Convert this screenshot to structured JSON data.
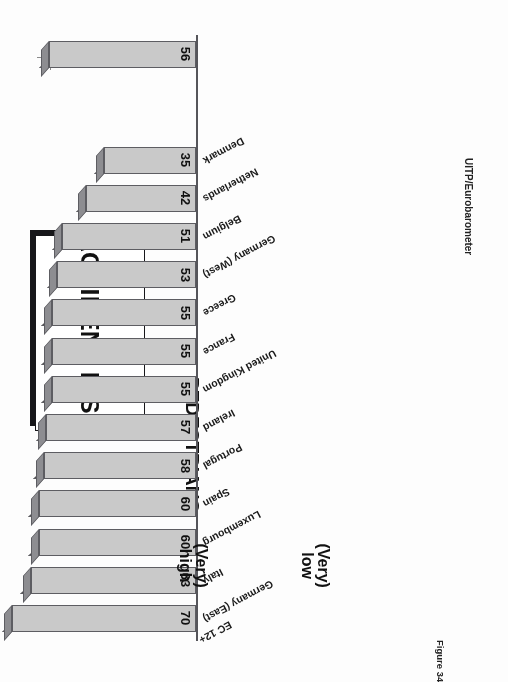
{
  "figure": {
    "title": "ACCIDENT RISK",
    "subtitle": "PEDESTRIANS",
    "source": "UITP/Eurobarometer",
    "caption": "Figure 34",
    "registration_mark": "registration-mark"
  },
  "chart_data": {
    "type": "bar",
    "orientation": "horizontal",
    "title": "ACCIDENT RISK",
    "subtitle": "PEDESTRIANS",
    "xlabel": "",
    "ylabel": "",
    "grid": false,
    "legend_position": "below-axis",
    "categories": [
      "Germany (East)",
      "Italy",
      "Luxembourg",
      "Spain",
      "Portugal",
      "Ireland",
      "United Kingdom",
      "France",
      "Greece",
      "Germany (West)",
      "Belgium",
      "Netherlands",
      "Denmark"
    ],
    "summary_category": "EC 12+",
    "series": [
      {
        "name": "(Very) high",
        "label_line1": "(Very)",
        "label_line2": "high",
        "values": [
          70,
          63,
          60,
          60,
          58,
          57,
          55,
          55,
          55,
          53,
          51,
          42,
          35
        ],
        "summary_value": 56,
        "labels_shown": true
      },
      {
        "name": "(Very) low",
        "label_line1": "(Very)",
        "label_line2": "low",
        "values": [
          25,
          29,
          31,
          33,
          36,
          35,
          37,
          38,
          40,
          41,
          44,
          53,
          58
        ],
        "summary_value": 44,
        "labels_shown": false
      }
    ],
    "colors": {
      "high_face": "#c9c9c9",
      "high_top": "#3a3a3e",
      "low_face": "#d7d7d7",
      "low_top": "#b9b9b9",
      "axis": "#55555a"
    }
  }
}
